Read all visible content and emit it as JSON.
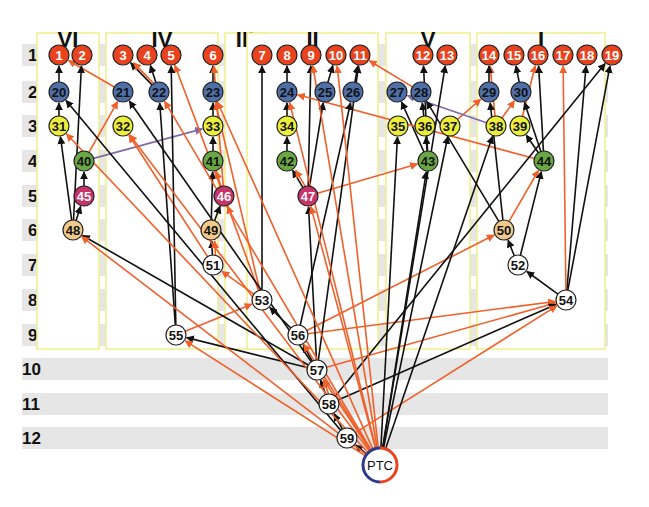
{
  "colors": {
    "red": "#e8431e",
    "blue": "#4f6fa8",
    "yellow": "#ecee3a",
    "green": "#6aa843",
    "magenta": "#c8336a",
    "tan": "#f0c98c",
    "white": "#ffffff",
    "edge_black": "#111111",
    "edge_orange": "#f0602a",
    "edge_purple": "#7e6aa8",
    "box": "#eef08a",
    "band": "#e6e6e6"
  },
  "rows": [
    {
      "label": "1",
      "y": 55
    },
    {
      "label": "2",
      "y": 92
    },
    {
      "label": "3",
      "y": 126
    },
    {
      "label": "4",
      "y": 161
    },
    {
      "label": "5",
      "y": 196
    },
    {
      "label": "6",
      "y": 230
    },
    {
      "label": "7",
      "y": 265
    },
    {
      "label": "8",
      "y": 300
    },
    {
      "label": "9",
      "y": 335
    },
    {
      "label": "10",
      "y": 369
    },
    {
      "label": "11",
      "y": 404
    },
    {
      "label": "12",
      "y": 438
    }
  ],
  "groups": [
    {
      "label": "VI",
      "x": 37,
      "w": 62
    },
    {
      "label": "IV",
      "x": 106,
      "w": 112
    },
    {
      "label": "III",
      "x": 225,
      "w": 40
    },
    {
      "label": "II",
      "x": 247,
      "w": 131
    },
    {
      "label": "V",
      "x": 386,
      "w": 84
    },
    {
      "label": "I",
      "x": 477,
      "w": 128
    }
  ],
  "nodes": [
    {
      "id": "1",
      "x": 59,
      "y": 55,
      "c": "red"
    },
    {
      "id": "2",
      "x": 82,
      "y": 55,
      "c": "red"
    },
    {
      "id": "3",
      "x": 123,
      "y": 55,
      "c": "red"
    },
    {
      "id": "4",
      "x": 147,
      "y": 55,
      "c": "red"
    },
    {
      "id": "5",
      "x": 171,
      "y": 55,
      "c": "red"
    },
    {
      "id": "6",
      "x": 213,
      "y": 55,
      "c": "red"
    },
    {
      "id": "7",
      "x": 262,
      "y": 55,
      "c": "red"
    },
    {
      "id": "8",
      "x": 287,
      "y": 55,
      "c": "red"
    },
    {
      "id": "9",
      "x": 311,
      "y": 55,
      "c": "red"
    },
    {
      "id": "10",
      "x": 336,
      "y": 55,
      "c": "red"
    },
    {
      "id": "11",
      "x": 360,
      "y": 55,
      "c": "red"
    },
    {
      "id": "12",
      "x": 423,
      "y": 55,
      "c": "red"
    },
    {
      "id": "13",
      "x": 447,
      "y": 55,
      "c": "red"
    },
    {
      "id": "14",
      "x": 489,
      "y": 55,
      "c": "red"
    },
    {
      "id": "15",
      "x": 514,
      "y": 55,
      "c": "red"
    },
    {
      "id": "16",
      "x": 538,
      "y": 55,
      "c": "red"
    },
    {
      "id": "17",
      "x": 563,
      "y": 55,
      "c": "red"
    },
    {
      "id": "18",
      "x": 587,
      "y": 55,
      "c": "red"
    },
    {
      "id": "19",
      "x": 612,
      "y": 55,
      "c": "red"
    },
    {
      "id": "20",
      "x": 59,
      "y": 92,
      "c": "blue"
    },
    {
      "id": "21",
      "x": 123,
      "y": 92,
      "c": "blue"
    },
    {
      "id": "22",
      "x": 159,
      "y": 92,
      "c": "blue"
    },
    {
      "id": "23",
      "x": 213,
      "y": 92,
      "c": "blue"
    },
    {
      "id": "24",
      "x": 287,
      "y": 92,
      "c": "blue"
    },
    {
      "id": "25",
      "x": 325,
      "y": 92,
      "c": "blue"
    },
    {
      "id": "26",
      "x": 353,
      "y": 92,
      "c": "blue"
    },
    {
      "id": "27",
      "x": 397,
      "y": 92,
      "c": "blue"
    },
    {
      "id": "28",
      "x": 421,
      "y": 92,
      "c": "blue"
    },
    {
      "id": "29",
      "x": 489,
      "y": 92,
      "c": "blue"
    },
    {
      "id": "30",
      "x": 521,
      "y": 92,
      "c": "blue"
    },
    {
      "id": "31",
      "x": 59,
      "y": 126,
      "c": "yellow"
    },
    {
      "id": "32",
      "x": 123,
      "y": 126,
      "c": "yellow"
    },
    {
      "id": "33",
      "x": 213,
      "y": 126,
      "c": "yellow"
    },
    {
      "id": "34",
      "x": 287,
      "y": 126,
      "c": "yellow"
    },
    {
      "id": "35",
      "x": 398,
      "y": 126,
      "c": "yellow"
    },
    {
      "id": "36",
      "x": 425,
      "y": 126,
      "c": "yellow"
    },
    {
      "id": "37",
      "x": 450,
      "y": 126,
      "c": "yellow"
    },
    {
      "id": "38",
      "x": 496,
      "y": 126,
      "c": "yellow"
    },
    {
      "id": "39",
      "x": 520,
      "y": 126,
      "c": "yellow"
    },
    {
      "id": "40",
      "x": 84,
      "y": 161,
      "c": "green"
    },
    {
      "id": "41",
      "x": 213,
      "y": 161,
      "c": "green"
    },
    {
      "id": "42",
      "x": 287,
      "y": 161,
      "c": "green"
    },
    {
      "id": "43",
      "x": 428,
      "y": 161,
      "c": "green"
    },
    {
      "id": "44",
      "x": 544,
      "y": 161,
      "c": "green"
    },
    {
      "id": "45",
      "x": 84,
      "y": 196,
      "c": "magenta"
    },
    {
      "id": "46",
      "x": 224,
      "y": 196,
      "c": "magenta"
    },
    {
      "id": "47",
      "x": 308,
      "y": 196,
      "c": "magenta"
    },
    {
      "id": "48",
      "x": 73,
      "y": 230,
      "c": "tan"
    },
    {
      "id": "49",
      "x": 211,
      "y": 230,
      "c": "tan"
    },
    {
      "id": "50",
      "x": 504,
      "y": 230,
      "c": "tan"
    },
    {
      "id": "51",
      "x": 213,
      "y": 265,
      "c": "white"
    },
    {
      "id": "52",
      "x": 518,
      "y": 265,
      "c": "white"
    },
    {
      "id": "53",
      "x": 262,
      "y": 300,
      "c": "white"
    },
    {
      "id": "54",
      "x": 566,
      "y": 300,
      "c": "white"
    },
    {
      "id": "55",
      "x": 176,
      "y": 335,
      "c": "white"
    },
    {
      "id": "56",
      "x": 298,
      "y": 335,
      "c": "white"
    },
    {
      "id": "57",
      "x": 317,
      "y": 370,
      "c": "white"
    },
    {
      "id": "58",
      "x": 329,
      "y": 404,
      "c": "white"
    },
    {
      "id": "59",
      "x": 347,
      "y": 438,
      "c": "white"
    }
  ],
  "ptc": {
    "label": "PTC",
    "x": 380,
    "y": 465
  },
  "edges": [
    {
      "f": "20",
      "t": "1",
      "k": "b"
    },
    {
      "f": "31",
      "t": "20",
      "k": "b"
    },
    {
      "f": "21",
      "t": "1",
      "k": "o",
      "via": [
        [
          92,
          92
        ],
        [
          85,
          92
        ],
        [
          64,
          72
        ]
      ]
    },
    {
      "f": "22",
      "t": "3",
      "k": "b"
    },
    {
      "f": "22",
      "t": "3",
      "k": "o"
    },
    {
      "f": "22",
      "t": "4",
      "k": "b"
    },
    {
      "f": "23",
      "t": "6",
      "k": "b"
    },
    {
      "f": "33",
      "t": "23",
      "k": "b"
    },
    {
      "f": "41",
      "t": "33",
      "k": "b"
    },
    {
      "f": "40",
      "t": "21",
      "k": "o"
    },
    {
      "f": "40",
      "t": "33",
      "k": "p"
    },
    {
      "f": "45",
      "t": "40",
      "k": "b"
    },
    {
      "f": "48",
      "t": "45",
      "k": "b"
    },
    {
      "f": "48",
      "t": "31",
      "k": "b"
    },
    {
      "f": "48",
      "t": "2",
      "k": "b"
    },
    {
      "f": "49",
      "t": "41",
      "k": "b"
    },
    {
      "f": "49",
      "t": "46",
      "k": "b"
    },
    {
      "f": "46",
      "t": "41",
      "k": "o"
    },
    {
      "f": "46",
      "t": "5",
      "k": "o"
    },
    {
      "f": "46",
      "t": "6",
      "k": "o"
    },
    {
      "f": "51",
      "t": "49",
      "k": "b"
    },
    {
      "f": "51",
      "t": "49",
      "k": "o"
    },
    {
      "f": "51",
      "t": "32",
      "k": "o"
    },
    {
      "f": "53",
      "t": "51",
      "k": "o"
    },
    {
      "f": "53",
      "t": "46",
      "k": "o"
    },
    {
      "f": "53",
      "t": "23",
      "k": "o"
    },
    {
      "f": "53",
      "t": "7",
      "k": "b"
    },
    {
      "f": "24",
      "t": "8",
      "k": "b"
    },
    {
      "f": "34",
      "t": "24",
      "k": "b"
    },
    {
      "f": "42",
      "t": "34",
      "k": "b"
    },
    {
      "f": "47",
      "t": "42",
      "k": "b"
    },
    {
      "f": "47",
      "t": "42",
      "k": "o"
    },
    {
      "f": "47",
      "t": "25",
      "k": "b"
    },
    {
      "f": "47",
      "t": "9",
      "k": "b"
    },
    {
      "f": "47",
      "t": "43",
      "k": "o"
    },
    {
      "f": "25",
      "t": "10",
      "k": "b"
    },
    {
      "f": "26",
      "t": "11",
      "k": "b"
    },
    {
      "f": "28",
      "t": "11",
      "k": "o"
    },
    {
      "f": "36",
      "t": "28",
      "k": "b"
    },
    {
      "f": "43",
      "t": "27",
      "k": "b"
    },
    {
      "f": "43",
      "t": "36",
      "k": "b"
    },
    {
      "f": "43",
      "t": "12",
      "k": "b"
    },
    {
      "f": "37",
      "t": "29",
      "k": "o"
    },
    {
      "f": "38",
      "t": "14",
      "k": "o"
    },
    {
      "f": "38",
      "t": "30",
      "k": "o"
    },
    {
      "f": "39",
      "t": "16",
      "k": "o"
    },
    {
      "f": "29",
      "t": "14",
      "k": "b"
    },
    {
      "f": "30",
      "t": "15",
      "k": "b"
    },
    {
      "f": "44",
      "t": "30",
      "k": "b"
    },
    {
      "f": "44",
      "t": "39",
      "k": "b"
    },
    {
      "f": "44",
      "t": "16",
      "k": "b"
    },
    {
      "f": "44",
      "t": "24",
      "k": "o"
    },
    {
      "f": "38",
      "t": "27",
      "k": "p"
    },
    {
      "f": "50",
      "t": "44",
      "k": "o"
    },
    {
      "f": "50",
      "t": "29",
      "k": "b"
    },
    {
      "f": "50",
      "t": "28",
      "k": "b"
    },
    {
      "f": "52",
      "t": "50",
      "k": "b"
    },
    {
      "f": "52",
      "t": "44",
      "k": "b"
    },
    {
      "f": "54",
      "t": "52",
      "k": "b"
    },
    {
      "f": "54",
      "t": "18",
      "k": "b"
    },
    {
      "f": "54",
      "t": "19",
      "k": "b"
    },
    {
      "f": "54",
      "t": "17",
      "k": "o"
    },
    {
      "f": "55",
      "t": "53",
      "k": "o"
    },
    {
      "f": "55",
      "t": "22",
      "k": "b"
    },
    {
      "f": "55",
      "t": "5",
      "k": "b"
    },
    {
      "f": "56",
      "t": "53",
      "k": "b"
    },
    {
      "f": "56",
      "t": "50",
      "k": "o"
    },
    {
      "f": "56",
      "t": "54",
      "k": "o"
    },
    {
      "f": "56",
      "t": "26",
      "k": "b"
    },
    {
      "f": "57",
      "t": "56",
      "k": "b"
    },
    {
      "f": "57",
      "t": "47",
      "k": "b"
    },
    {
      "f": "57",
      "t": "55",
      "k": "b"
    },
    {
      "f": "57",
      "t": "48",
      "k": "b"
    },
    {
      "f": "57",
      "t": "21",
      "k": "b"
    },
    {
      "f": "57",
      "t": "11",
      "k": "b"
    },
    {
      "f": "57",
      "t": "54",
      "k": "o"
    },
    {
      "f": "58",
      "t": "57",
      "k": "b"
    },
    {
      "f": "58",
      "t": "57",
      "k": "o"
    },
    {
      "f": "58",
      "t": "54",
      "k": "b"
    },
    {
      "f": "58",
      "t": "19",
      "k": "b"
    },
    {
      "f": "59",
      "t": "58",
      "k": "b"
    },
    {
      "f": "59",
      "t": "20",
      "k": "b"
    },
    {
      "f": "59",
      "t": "54",
      "k": "o"
    },
    {
      "f": "ptc",
      "t": "59",
      "k": "b"
    },
    {
      "f": "ptc",
      "t": "35",
      "k": "b"
    },
    {
      "f": "ptc",
      "t": "43",
      "k": "b"
    },
    {
      "f": "ptc",
      "t": "37",
      "k": "b"
    },
    {
      "f": "ptc",
      "t": "13",
      "k": "b"
    },
    {
      "f": "ptc",
      "t": "38",
      "k": "b"
    },
    {
      "f": "ptc",
      "t": "48",
      "k": "o"
    },
    {
      "f": "ptc",
      "t": "31",
      "k": "o"
    },
    {
      "f": "ptc",
      "t": "32",
      "k": "o"
    },
    {
      "f": "ptc",
      "t": "22",
      "k": "o"
    },
    {
      "f": "ptc",
      "t": "55",
      "k": "o"
    },
    {
      "f": "ptc",
      "t": "56",
      "k": "o"
    },
    {
      "f": "ptc",
      "t": "57",
      "k": "o"
    },
    {
      "f": "ptc",
      "t": "24",
      "k": "o"
    },
    {
      "f": "ptc",
      "t": "9",
      "k": "o"
    },
    {
      "f": "ptc",
      "t": "47",
      "k": "o"
    },
    {
      "f": "ptc",
      "t": "10",
      "k": "o"
    },
    {
      "f": "ptc",
      "t": "23",
      "k": "o"
    }
  ]
}
